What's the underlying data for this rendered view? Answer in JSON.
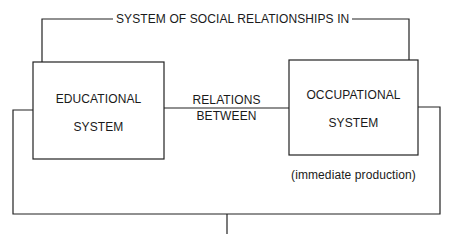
{
  "diagram": {
    "title": "SYSTEM OF SOCIAL RELATIONSHIPS IN",
    "nodes": [
      {
        "id": "educational",
        "lines": [
          "EDUCATIONAL",
          "SYSTEM"
        ]
      },
      {
        "id": "occupational",
        "lines": [
          "OCCUPATIONAL",
          "SYSTEM"
        ],
        "note": "(immediate production)"
      }
    ],
    "connector": {
      "lines": [
        "RELATIONS",
        "BETWEEN"
      ]
    },
    "colors": {
      "stroke": "#222222",
      "background": "#ffffff",
      "text": "#1a1a1a"
    }
  }
}
